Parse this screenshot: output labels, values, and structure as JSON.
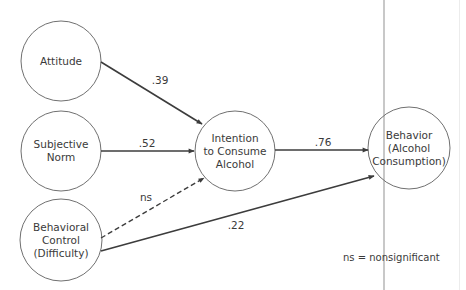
{
  "diagram": {
    "type": "path-model",
    "colors": {
      "stroke": "#3c3c3c",
      "circle_stroke": "#707070",
      "text": "#3a3a3a",
      "divider": "#c8c8c8",
      "divider_faint": "#ececec"
    },
    "nodes": {
      "attitude": {
        "label": "Attitude"
      },
      "subjective_norm": {
        "label": "Subjective\nNorm"
      },
      "behavioral_control": {
        "label": "Behavioral\nControl\n(Difficulty)"
      },
      "intention": {
        "label": "Intention\nto Consume\nAlcohol"
      },
      "behavior": {
        "label": "Behavior\n(Alcohol\nConsumption)"
      }
    },
    "edges": {
      "attitude_to_intention": {
        "label": ".39",
        "style": "solid"
      },
      "norm_to_intention": {
        "label": ".52",
        "style": "solid"
      },
      "control_to_intention": {
        "label": "ns",
        "style": "dashed"
      },
      "intention_to_behavior": {
        "label": ".76",
        "style": "solid"
      },
      "control_to_behavior": {
        "label": ".22",
        "style": "solid"
      }
    },
    "legend": "ns = nonsignificant"
  }
}
